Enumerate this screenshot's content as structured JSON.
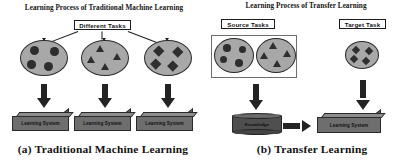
{
  "figure": {
    "caption_a": "(a)  Traditional Machine Learning",
    "caption_a_index": "(a)",
    "caption_a_text": "Traditional Machine Learning",
    "caption_b": "(b)  Transfer Learning",
    "caption_b_index": "(b)",
    "caption_b_text": "Transfer Learning"
  },
  "panel_a": {
    "title": "Learning Process of Traditional Machine Learning",
    "tag_label": "Different Tasks",
    "tasks": [
      {
        "name": "task-circles",
        "glyph": "circle",
        "count": 4
      },
      {
        "name": "task-triangles",
        "glyph": "triangle",
        "count": 4
      },
      {
        "name": "task-diamonds",
        "glyph": "diamond",
        "count": 4
      }
    ],
    "systems": [
      {
        "label": "Learning System"
      },
      {
        "label": "Learning System"
      },
      {
        "label": "Learning System"
      }
    ],
    "arrows": [
      {
        "name": "arrow-task-1-to-system-1",
        "direction": "down"
      },
      {
        "name": "arrow-task-2-to-system-2",
        "direction": "down"
      },
      {
        "name": "arrow-task-3-to-system-3",
        "direction": "down"
      }
    ]
  },
  "panel_b": {
    "title": "Learning Process of Transfer Learning",
    "source_tag_label": "Source Tasks",
    "target_tag_label": "Target Task",
    "source_tasks": [
      {
        "name": "source-task-circles",
        "glyph": "circle",
        "count": 4
      },
      {
        "name": "source-task-triangles",
        "glyph": "triangle",
        "count": 4
      }
    ],
    "target_tasks": [
      {
        "name": "target-task-diamonds",
        "glyph": "diamond",
        "count": 4
      }
    ],
    "knowledge_label": "Knowledge",
    "system_label": "Learning System",
    "arrows": [
      {
        "name": "arrow-source-to-knowledge",
        "direction": "down"
      },
      {
        "name": "arrow-knowledge-to-system",
        "direction": "right"
      },
      {
        "name": "arrow-target-to-system",
        "direction": "down"
      }
    ]
  },
  "colors": {
    "ellipse_fill": "#a8a8a8",
    "glyph_fill": "#2e2e2e",
    "box_fill": "#6e6e6e",
    "cylinder_fill": "#4f4f4f",
    "arrow_fill": "#232323",
    "outline": "#2a2a2a",
    "background": "#ffffff"
  }
}
